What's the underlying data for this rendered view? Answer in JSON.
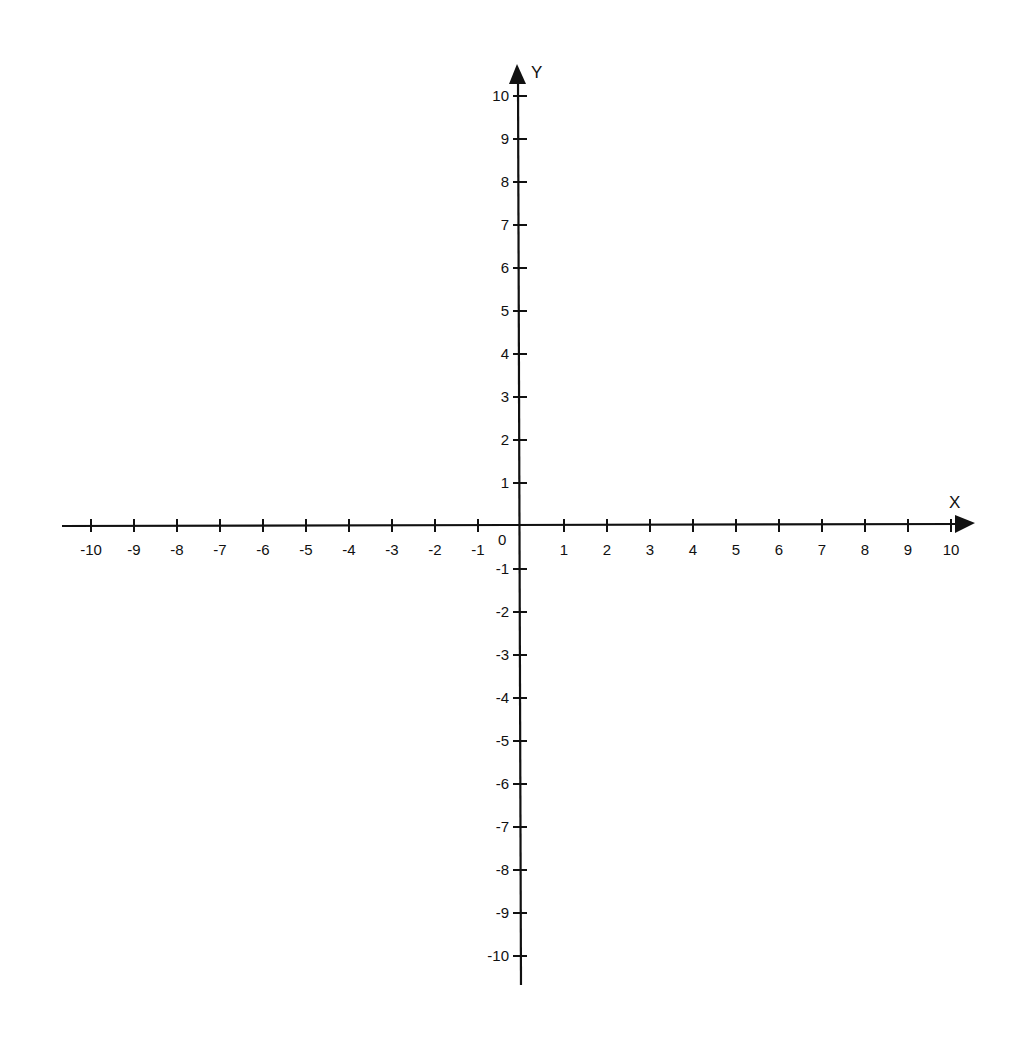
{
  "chart_data": {
    "type": "scatter",
    "title": "",
    "xlabel": "X",
    "ylabel": "Y",
    "xlim": [
      -10,
      10
    ],
    "ylim": [
      -10,
      10
    ],
    "grid": false,
    "legend": null,
    "x_ticks": [
      -10,
      -9,
      -8,
      -7,
      -6,
      -5,
      -4,
      -3,
      -2,
      -1,
      1,
      2,
      3,
      4,
      5,
      6,
      7,
      8,
      9,
      10
    ],
    "y_ticks": [
      10,
      9,
      8,
      7,
      6,
      5,
      4,
      3,
      2,
      1,
      -1,
      -2,
      -3,
      -4,
      -5,
      -6,
      -7,
      -8,
      -9,
      -10
    ],
    "origin_label": "0",
    "series": []
  },
  "axes": {
    "x_label": "X",
    "y_label": "Y",
    "origin_label": "0"
  },
  "colors": {
    "axis": "#111111",
    "background": "#ffffff"
  }
}
